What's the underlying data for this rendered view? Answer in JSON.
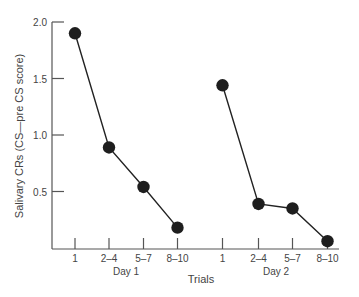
{
  "chart_data": {
    "type": "line",
    "title": "",
    "xlabel": "Trials",
    "ylabel": "Salivary CRs (CS—pre CS score)",
    "ylim": [
      0,
      2.0
    ],
    "yticks": [
      "0.5",
      "1.0",
      "1.5",
      "2.0"
    ],
    "grid": false,
    "legend": null,
    "groups": [
      {
        "name": "Day 1",
        "categories": [
          "1",
          "2–4",
          "5–7",
          "8–10"
        ],
        "values": [
          1.9,
          0.89,
          0.54,
          0.18
        ]
      },
      {
        "name": "Day 2",
        "categories": [
          "1",
          "2–4",
          "5–7",
          "8–10"
        ],
        "values": [
          1.44,
          0.39,
          0.35,
          0.06
        ]
      }
    ]
  },
  "labels": {
    "ylabel": "Salivary CRs (CS—pre CS score)",
    "xlabel": "Trials",
    "y_ticks": [
      "2.0",
      "1.5",
      "1.0",
      "0.5"
    ],
    "day1": {
      "label": "Day 1",
      "ticks": [
        "1",
        "2–4",
        "5–7",
        "8–10"
      ]
    },
    "day2": {
      "label": "Day 2",
      "ticks": [
        "1",
        "2–4",
        "5–7",
        "8–10"
      ]
    }
  }
}
